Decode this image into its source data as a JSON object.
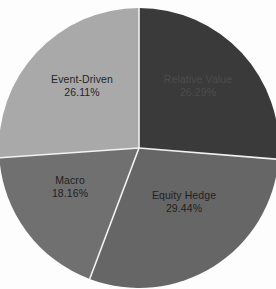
{
  "chart_data": {
    "type": "pie",
    "title": "",
    "subtitle": "",
    "xlabel": "",
    "ylabel": "",
    "grid": false,
    "legend_position": "none",
    "labels_inside_slices": true,
    "start_angle_deg": 0,
    "direction": "clockwise",
    "center_px": [
      139,
      148
    ],
    "radius_px": 140,
    "divider_color": "#f2f2f2",
    "background_color": "#fdfdfd",
    "categories": [
      "Relative Value",
      "Equity Hedge",
      "Macro",
      "Event-Driven"
    ],
    "values": [
      26.29,
      29.44,
      18.16,
      26.11
    ],
    "value_unit": "%",
    "total": 100.0,
    "slices": [
      {
        "name": "Relative Value",
        "label": "Relative Value",
        "value": 26.29,
        "value_text": "26.29%",
        "color": "#3a3a3a",
        "text_color": "#4c4c4c",
        "start_angle_deg": 0.0,
        "end_angle_deg": 94.64
      },
      {
        "name": "Equity Hedge",
        "label": "Equity Hedge",
        "value": 29.44,
        "value_text": "29.44%",
        "color": "#666666",
        "text_color": "#1f1f1f",
        "start_angle_deg": 94.64,
        "end_angle_deg": 200.62
      },
      {
        "name": "Macro",
        "label": "Macro",
        "value": 18.16,
        "value_text": "18.16%",
        "color": "#707070",
        "text_color": "#1f1f1f",
        "start_angle_deg": 200.62,
        "end_angle_deg": 266.0
      },
      {
        "name": "Event-Driven",
        "label": "Event-Driven",
        "value": 26.11,
        "value_text": "26.11%",
        "color": "#a9a9a9",
        "text_color": "#262626",
        "start_angle_deg": 266.0,
        "end_angle_deg": 360.0
      }
    ]
  },
  "colors": {
    "relative_value": "#3a3a3a",
    "equity_hedge": "#666666",
    "macro": "#707070",
    "event_driven": "#a9a9a9",
    "divider": "#f2f2f2",
    "background": "#fdfdfd"
  }
}
